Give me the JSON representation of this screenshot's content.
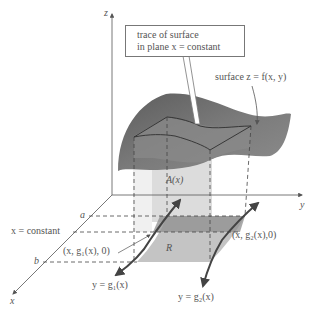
{
  "figure": {
    "type": "3d-surface-slice-diagram",
    "axes": {
      "z_label": "z",
      "y_label": "y",
      "x_label": "x"
    },
    "callout": {
      "line1": "trace of surface",
      "line2": "in plane x = constant"
    },
    "labels": {
      "surface": "surface z = f(x, y)",
      "area": "A(x)",
      "region": "R",
      "a": "a",
      "b": "b",
      "x_constant": "x = constant",
      "point_g1": "(x, g₁(x), 0)",
      "point_g2": "(x, g₂(x),0)",
      "curve_g1": "y = g₁(x)",
      "curve_g2": "y = g₂(x)"
    },
    "colors": {
      "surface_dark": "#6e6e6e",
      "surface_light": "#9a9a9a",
      "cross_section": "#d9d9d9",
      "region": "#bdbdbd",
      "region_strip": "#8f8f8f",
      "axis": "#555555",
      "text": "#555555"
    }
  }
}
